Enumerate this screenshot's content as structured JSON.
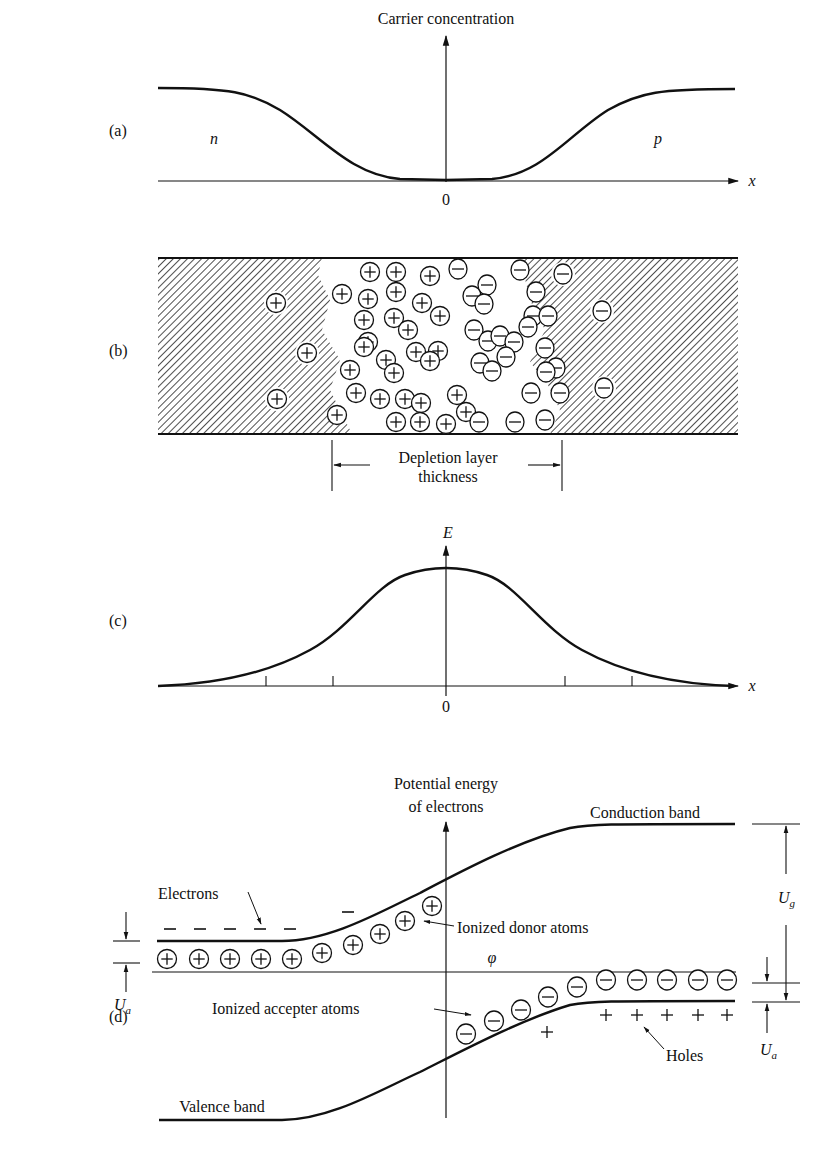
{
  "panels": {
    "a": {
      "label": "(a)",
      "y_axis_title": "Carrier concentration",
      "x_axis_symbol": "x",
      "origin_label": "0",
      "left_region": "n",
      "right_region": "p"
    },
    "b": {
      "label": "(b)",
      "dimension_label_line1": "Depletion layer",
      "dimension_label_line2": "thickness",
      "positive_ion_symbol": "+",
      "negative_ion_symbol": "−"
    },
    "c": {
      "label": "(c)",
      "y_axis_symbol": "E",
      "x_axis_symbol": "x",
      "origin_label": "0"
    },
    "d": {
      "label": "(d)",
      "y_axis_title_line1": "Potential energy",
      "y_axis_title_line2": "of electrons",
      "conduction_band": "Conduction band",
      "valence_band": "Valence band",
      "electrons": "Electrons",
      "ionized_donor_atoms": "Ionized donor atoms",
      "ionized_accepter_atoms": "Ionized accepter atoms",
      "holes": "Holes",
      "fermi_symbol": "φ",
      "ug_symbol": "U",
      "ug_sub": "g",
      "ua_symbol": "U",
      "ua_sub": "a"
    }
  },
  "colors": {
    "ink": "#111111",
    "background": "#ffffff"
  }
}
